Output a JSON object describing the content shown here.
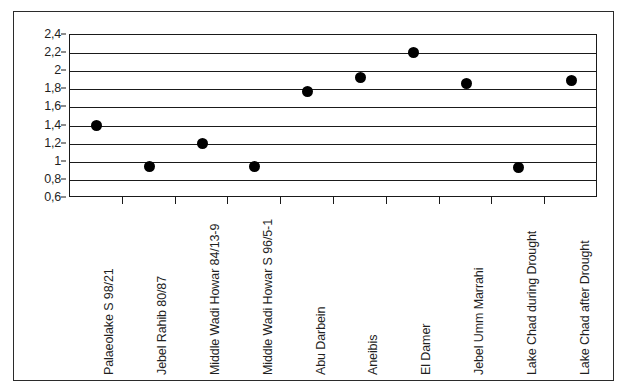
{
  "chart_data": {
    "type": "scatter",
    "title": "",
    "subtitle": "",
    "xlabel": "",
    "ylabel": "",
    "grid": true,
    "legend": false,
    "legend_position": "none",
    "ylim": [
      0.6,
      2.4
    ],
    "y_ticks": [
      2.4,
      2.2,
      2.0,
      1.8,
      1.6,
      1.4,
      1.2,
      1.0,
      0.8,
      0.6
    ],
    "y_tick_labels": [
      "2,4",
      "2,2",
      "2",
      "1,8",
      "1,6",
      "1,4",
      "1,2",
      "1",
      "0,8",
      "0,6"
    ],
    "decimal_separator": ",",
    "marker": "filled-circle",
    "marker_color": "#000000",
    "categories": [
      "Palaeolake S 98/21",
      "Jebel Rahib 80/87",
      "Middle Wadi Howar 84/13-9",
      "Middle Wadi Howar S 96/5-1",
      "Abu Darbein",
      "Aneibis",
      "El Damer",
      "Jebel Umm Marrahi",
      "Lake Chad during Drought",
      "Lake Chad after Drought"
    ],
    "values": [
      1.4,
      0.95,
      1.2,
      0.95,
      1.78,
      1.93,
      2.21,
      1.86,
      0.94,
      1.9
    ]
  },
  "style": {
    "frame_color": "#2b2b2b",
    "axis_color": "#1a1a1a",
    "grid_color": "#1a1a1a",
    "background": "#ffffff",
    "text_color": "#1f1f1f"
  }
}
